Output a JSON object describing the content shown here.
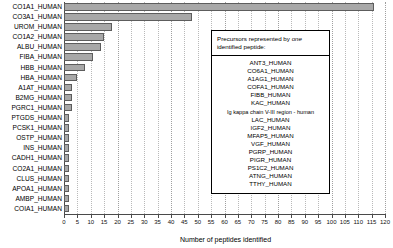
{
  "chart_data": {
    "type": "bar",
    "orientation": "horizontal",
    "title": "",
    "xlabel": "Number of peptides identified",
    "ylabel": "",
    "xlim": [
      0,
      120
    ],
    "xticks": [
      0,
      5,
      10,
      15,
      20,
      25,
      30,
      35,
      40,
      45,
      50,
      55,
      60,
      65,
      70,
      75,
      80,
      85,
      90,
      95,
      100,
      105,
      110,
      115,
      120
    ],
    "grid": true,
    "grid_axis": "x",
    "legend": "none",
    "categories": [
      "CO1A1_HUMAN",
      "CO3A1_HUMAN",
      "UROM_HUMAN",
      "CO1A2_HUMAN",
      "ALBU_HUMAN",
      "FIBA_HUMAN",
      "HBB_HUMAN",
      "HBA_HUMAN",
      "A1AT_HUMAN",
      "B2MG_HUMAN",
      "PGRC1_HUMAN",
      "PTGDS_HUMAN",
      "PCSK1_HUMAN",
      "OSTP_HUMAN",
      "INS_HUMAN",
      "CADH1_HUMAN",
      "CO2A1_HUMAN",
      "CLUS_HUMAN",
      "APOA1_HUMAN",
      "AMBP_HUMAN",
      "COIA1_HUMAN"
    ],
    "values": [
      116,
      48,
      18,
      15,
      14,
      11,
      8,
      5,
      3,
      3,
      3,
      2,
      2,
      2,
      2,
      2,
      2,
      2,
      2,
      2,
      2
    ]
  },
  "annotation": {
    "heading_line1_pre": "Precursors represented by ",
    "heading_line1_ital": "one",
    "heading_line2": "identified peptide:",
    "items": [
      "ANT3_HUMAN",
      "CO6A1_HUMAN",
      "A1AG1_HUMAN",
      "COFA1_HUMAN",
      "FIBB_HUMAN",
      "KAC_HUMAN",
      "Ig kappa chain V-III region - human",
      "LAC_HUMAN",
      "IGF2_HUMAN",
      "MFAP5_HUMAN",
      "VGF_HUMAN",
      "PGRP_HUMAN",
      "PIGR_HUMAN",
      "PS1C2_HUMAN",
      "ATNG_HUMAN",
      "TTHY_HUMAN"
    ]
  },
  "colors": {
    "bar_fill": "#a8a8a8",
    "bar_stroke": "#5d5d5d",
    "grid": "#b9b9b9",
    "axis": "#4a4a4a",
    "text": "#000000",
    "background": "#ffffff"
  }
}
